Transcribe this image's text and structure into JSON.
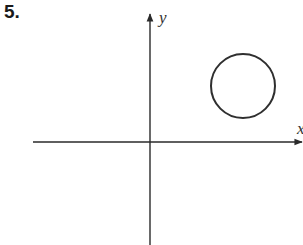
{
  "problem": {
    "number": "5."
  },
  "axes": {
    "x_label": "x",
    "y_label": "y",
    "origin_px": [
      150,
      142
    ],
    "color": "#2a2a2a"
  },
  "shapes": [
    {
      "type": "circle",
      "center_px": [
        243,
        86
      ],
      "radius_px": 32,
      "quadrant": "I",
      "stroke": "#2f2f2f",
      "fill": "none"
    }
  ]
}
